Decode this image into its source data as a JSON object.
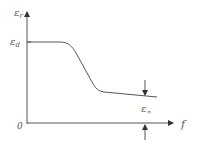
{
  "diagram": {
    "y_axis": {
      "label": "ε",
      "label_sub": "r"
    },
    "x_axis": {
      "label": "f"
    },
    "origin_label": "0",
    "levels": {
      "static": {
        "label": "ε",
        "label_sub": "d"
      },
      "high_freq": {
        "label": "ε",
        "label_sub": "∞"
      }
    },
    "colors": {
      "line": "#555555",
      "text": "#555555",
      "background": "#ffffff"
    }
  }
}
